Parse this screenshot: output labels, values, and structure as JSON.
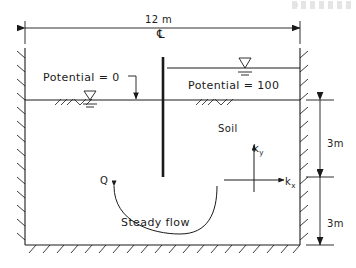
{
  "figure": {
    "type": "engineering-schematic",
    "width_px": 356,
    "height_px": 268,
    "ink_color": "#1a1a1a",
    "background_color": "#ffffff"
  },
  "dimensions": {
    "top_width": "12 m",
    "centerline_symbol": "℄",
    "depth_upper": "3m",
    "depth_lower": "3m"
  },
  "boundary_conditions": {
    "left_potential": "Potential = 0",
    "right_potential": "Potential = 100"
  },
  "annotations": {
    "soil": "Soil",
    "discharge": "Q",
    "flow_caption": "Steady flow"
  },
  "permeability": {
    "ky_label": "k",
    "ky_sub": "y",
    "kx_label": "k",
    "kx_sub": "x"
  },
  "geometry": {
    "domain_left_x": 25,
    "domain_right_x": 300,
    "ground_surface_y": 100,
    "domain_bottom_y": 245,
    "sheetpile_x": 163,
    "sheetpile_top_y": 57,
    "sheetpile_tip_y": 177,
    "upstream_water_y": 68,
    "dim_line_y": 28
  }
}
